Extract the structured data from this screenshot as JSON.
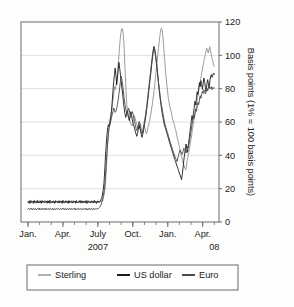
{
  "chart_data": {
    "type": "line",
    "title": "",
    "subtitle": "",
    "xlabel": "",
    "ylabel": "Basis points (1% = 100 basis points)",
    "ylim": [
      0,
      120
    ],
    "ytick_values": [
      0,
      20,
      40,
      60,
      80,
      100,
      120
    ],
    "ytick_labels": [
      "0",
      "20",
      "40",
      "60",
      "80",
      "100",
      "120"
    ],
    "y_axis_position": "right",
    "grid": true,
    "grid_axis": "y",
    "legend_position": "bottom",
    "x_axis": {
      "tick_labels": [
        "Jan.",
        "Apr.",
        "July",
        "Oct.",
        "Jan.",
        "Apr."
      ],
      "tick_positions_months": [
        0,
        3,
        6,
        9,
        12,
        15
      ],
      "minor_tick_interval": "month",
      "range_months": [
        -0.6,
        16.4
      ],
      "year_labels": [
        {
          "text": "2007",
          "at_month": 6.0
        },
        {
          "text": "08",
          "at_month": 16.0
        }
      ]
    },
    "series": [
      {
        "name": "Sterling",
        "color": "#9c9c9c",
        "values": [
          12.5,
          11.4,
          12.8,
          11.2,
          13.1,
          11.5,
          12.4,
          11.0,
          13.3,
          11.8,
          12.6,
          11.1,
          13.0,
          11.6,
          12.2,
          11.4,
          12.9,
          11.3,
          12.7,
          11.9,
          12.1,
          11.5,
          13.2,
          11.7,
          12.4,
          11.2,
          12.8,
          11.6,
          12.3,
          11.0,
          13.1,
          11.8,
          12.5,
          11.4,
          12.9,
          11.2,
          12.6,
          11.7,
          12.2,
          11.5,
          13.0,
          11.3,
          12.7,
          11.9,
          12.4,
          11.1,
          12.8,
          11.6,
          12.3,
          11.4,
          13.1,
          11.8,
          12.5,
          11.2,
          12.9,
          11.5,
          12.2,
          11.7,
          13.0,
          11.3,
          12.6,
          11.9,
          12.4,
          11.0,
          12.8,
          11.6,
          12.1,
          11.4,
          13.2,
          11.8,
          12.5,
          11.2,
          12.7,
          11.5,
          12.3,
          11.9,
          13.0,
          11.4,
          12.6,
          11.1,
          12.9,
          11.7,
          12.2,
          11.5,
          12.8,
          11.3,
          12.4,
          11.8,
          13.1,
          11.6,
          12.5,
          11.2,
          12.7,
          11.9,
          12.3,
          11.4,
          12.9,
          11.7,
          13.4,
          12.6,
          14.8,
          16.5,
          19.2,
          24.6,
          32.5,
          41.8,
          50.2,
          56.4,
          59.8,
          62.5,
          64.1,
          66.8,
          70.5,
          74.2,
          78.6,
          81.3,
          79.4,
          83.2,
          86.5,
          91.2,
          96.8,
          102.4,
          108.6,
          113.2,
          115.8,
          116.2,
          113.5,
          108.2,
          98.6,
          88.4,
          78.2,
          70.5,
          66.8,
          64.2,
          62.5,
          60.8,
          59.4,
          58.2,
          57.6,
          59.1,
          61.4,
          63.8,
          62.2,
          60.5,
          58.8,
          57.2,
          56.4,
          55.8,
          57.1,
          59.4,
          56.2,
          54.8,
          53.5,
          55.2,
          57.8,
          56.4,
          54.2,
          52.8,
          54.5,
          56.8,
          58.2,
          60.4,
          62.8,
          65.2,
          68.4,
          71.2,
          74.8,
          78.2,
          82.4,
          86.8,
          91.2,
          95.6,
          99.8,
          104.2,
          108.6,
          112.4,
          115.2,
          116.4,
          114.8,
          110.2,
          104.6,
          98.2,
          92.4,
          86.8,
          82.4,
          78.6,
          74.2,
          71.8,
          69.4,
          67.2,
          65.8,
          63.4,
          61.2,
          59.8,
          58.4,
          56.2,
          54.8,
          52.4,
          50.2,
          48.6,
          46.2,
          44.8,
          42.4,
          40.2,
          38.6,
          36.4,
          35.2,
          33.8,
          32.4,
          31.2,
          33.6,
          36.8,
          39.2,
          41.6,
          44.2,
          46.8,
          49.4,
          52.2,
          55.6,
          58.4,
          61.2,
          63.8,
          66.4,
          69.2,
          72.6,
          75.4,
          78.2,
          80.6,
          83.4,
          86.2,
          88.6,
          91.2,
          93.8,
          96.4,
          98.2,
          100.4,
          102.6,
          104.2,
          103.1,
          101.4,
          103.8,
          105.2,
          102.6,
          100.4,
          98.2,
          96.4,
          94.2,
          93.4
        ]
      },
      {
        "name": "US dollar",
        "color": "#1c1c1c",
        "values": [
          11.8,
          12.4,
          11.2,
          12.8,
          11.6,
          12.2,
          11.9,
          12.5,
          11.3,
          12.7,
          11.8,
          12.1,
          11.5,
          12.9,
          11.4,
          12.3,
          11.7,
          12.6,
          11.2,
          12.8,
          11.9,
          12.4,
          11.6,
          12.2,
          11.8,
          12.5,
          11.3,
          12.7,
          11.4,
          12.9,
          11.7,
          12.1,
          11.5,
          12.6,
          11.8,
          12.3,
          11.2,
          12.8,
          11.9,
          12.4,
          11.6,
          12.2,
          11.4,
          12.7,
          11.8,
          12.5,
          11.3,
          12.9,
          11.7,
          12.1,
          11.5,
          12.6,
          11.9,
          12.3,
          11.2,
          12.8,
          11.6,
          12.4,
          11.8,
          12.2,
          11.4,
          12.7,
          11.9,
          12.5,
          11.3,
          12.8,
          11.6,
          12.1,
          11.8,
          12.4,
          11.5,
          12.9,
          11.7,
          12.2,
          11.4,
          12.6,
          11.9,
          12.3,
          11.2,
          12.8,
          11.6,
          12.5,
          11.8,
          12.1,
          11.4,
          12.7,
          11.9,
          12.4,
          11.5,
          12.9,
          11.7,
          12.3,
          11.2,
          12.6,
          11.8,
          12.5,
          12.2,
          12.8,
          13.6,
          14.2,
          16.8,
          19.4,
          23.8,
          31.2,
          39.6,
          46.8,
          52.4,
          56.8,
          58.4,
          57.2,
          59.8,
          62.4,
          66.8,
          72.4,
          78.6,
          84.2,
          88.6,
          92.4,
          87.8,
          82.4,
          86.2,
          91.4,
          95.8,
          92.4,
          88.6,
          84.2,
          80.4,
          76.8,
          72.4,
          68.6,
          65.2,
          62.8,
          64.2,
          66.8,
          64.4,
          62.2,
          60.8,
          63.4,
          66.2,
          63.8,
          61.4,
          59.2,
          57.8,
          56.4,
          54.2,
          52.8,
          51.4,
          53.2,
          55.8,
          58.4,
          56.2,
          54.8,
          52.4,
          50.8,
          52.6,
          55.2,
          57.8,
          60.4,
          63.2,
          66.8,
          70.4,
          74.2,
          78.6,
          82.4,
          86.8,
          90.2,
          94.6,
          98.4,
          102.2,
          105.4,
          103.8,
          101.2,
          97.6,
          93.4,
          88.2,
          83.6,
          79.4,
          75.2,
          71.8,
          68.4,
          65.2,
          62.8,
          60.4,
          58.2,
          56.8,
          55.4,
          53.8,
          52.4,
          50.8,
          49.2,
          47.6,
          46.2,
          44.8,
          43.2,
          41.8,
          40.4,
          38.8,
          37.4,
          36.2,
          34.8,
          33.4,
          32.2,
          30.8,
          29.4,
          28.2,
          26.8,
          25.4,
          28.6,
          32.4,
          36.8,
          40.2,
          43.6,
          46.8,
          44.2,
          41.8,
          45.4,
          49.2,
          52.8,
          56.4,
          60.2,
          63.8,
          61.4,
          65.2,
          68.8,
          72.4,
          70.2,
          74.6,
          78.2,
          76.4,
          80.2,
          83.6,
          81.2,
          84.8,
          82.4,
          79.6,
          83.2,
          86.4,
          84.2,
          80.8,
          78.4,
          82.6,
          85.4,
          83.2,
          80.4,
          84.6,
          87.2,
          88.4,
          86.8,
          88.2,
          89.4,
          88.6
        ]
      },
      {
        "name": "Euro",
        "color": "#4a4a4a",
        "values": [
          7.8,
          8.2,
          7.4,
          8.0,
          7.6,
          8.3,
          7.2,
          7.9,
          8.1,
          7.5,
          8.2,
          7.3,
          7.8,
          8.0,
          7.6,
          8.4,
          7.2,
          7.9,
          8.1,
          7.4,
          8.2,
          7.6,
          7.8,
          8.3,
          7.2,
          7.9,
          8.0,
          7.5,
          8.2,
          7.4,
          7.8,
          8.1,
          7.6,
          8.3,
          7.2,
          7.9,
          8.0,
          7.4,
          8.2,
          7.6,
          7.8,
          8.1,
          7.3,
          7.9,
          8.2,
          7.5,
          8.0,
          7.6,
          8.3,
          7.2,
          7.8,
          8.1,
          7.4,
          8.2,
          7.6,
          7.9,
          8.0,
          7.3,
          8.2,
          7.5,
          7.8,
          8.1,
          7.6,
          8.3,
          7.2,
          7.9,
          8.0,
          7.4,
          8.2,
          7.6,
          7.8,
          8.1,
          7.3,
          7.9,
          8.2,
          7.5,
          8.0,
          7.6,
          8.3,
          7.2,
          7.8,
          8.1,
          7.4,
          8.2,
          7.6,
          7.9,
          8.0,
          7.3,
          8.2,
          7.5,
          7.8,
          8.1,
          7.6,
          8.3,
          7.9,
          8.4,
          8.8,
          9.4,
          10.2,
          11.6,
          13.4,
          15.8,
          18.4,
          22.6,
          28.4,
          35.2,
          42.6,
          48.4,
          53.2,
          56.8,
          58.4,
          60.2,
          62.8,
          64.4,
          66.2,
          68.4,
          67.2,
          65.8,
          66.4,
          68.2,
          70.4,
          73.2,
          76.8,
          80.4,
          84.2,
          87.6,
          85.2,
          82.4,
          78.6,
          74.2,
          70.8,
          68.4,
          66.2,
          64.8,
          66.4,
          68.2,
          66.8,
          64.2,
          62.8,
          64.6,
          66.2,
          64.8,
          62.4,
          60.8,
          58.4,
          56.2,
          54.8,
          56.4,
          58.2,
          60.4,
          58.8,
          56.4,
          54.2,
          52.8,
          54.6,
          57.2,
          59.8,
          62.4,
          65.2,
          68.6,
          72.4,
          76.2,
          80.4,
          84.6,
          88.2,
          92.4,
          96.8,
          100.2,
          103.4,
          104.8,
          102.4,
          99.8,
          96.2,
          92.4,
          88.6,
          84.2,
          80.4,
          76.8,
          73.2,
          70.4,
          67.8,
          65.2,
          62.8,
          60.4,
          58.2,
          56.8,
          55.2,
          53.8,
          52.2,
          50.6,
          49.2,
          47.8,
          46.2,
          44.8,
          43.4,
          42.2,
          40.8,
          39.4,
          38.2,
          37.4,
          36.2,
          38.4,
          40.2,
          41.8,
          43.2,
          42.4,
          41.2,
          40.6,
          42.4,
          44.2,
          43.6,
          42.8,
          41.4,
          43.2,
          45.4,
          44.8,
          47.2,
          49.8,
          52.4,
          55.2,
          58.4,
          61.2,
          63.8,
          62.4,
          65.2,
          67.8,
          66.4,
          69.2,
          71.8,
          70.4,
          73.2,
          75.8,
          74.2,
          76.8,
          78.4,
          77.2,
          79.4,
          78.2,
          76.8,
          79.2,
          80.4,
          78.6,
          80.2,
          81.4,
          79.8,
          80.6,
          81.2,
          79.4,
          80.8,
          80.2,
          80.4
        ]
      }
    ]
  },
  "legend": {
    "items": [
      {
        "label": "Sterling",
        "color": "#9c9c9c"
      },
      {
        "label": "US dollar",
        "color": "#1c1c1c"
      },
      {
        "label": "Euro",
        "color": "#4a4a4a"
      }
    ]
  },
  "colors": {
    "background": "#fdfdfc",
    "plot_background": "#ffffff",
    "frame": "#6b6b6b",
    "gridline": "#d8d8d8",
    "text": "#232323"
  }
}
